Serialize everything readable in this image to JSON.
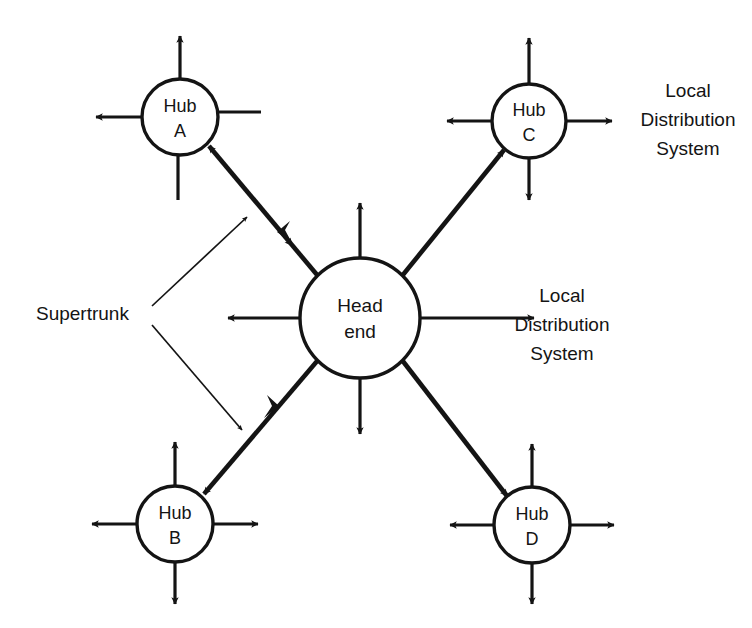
{
  "diagram": {
    "background_color": "#ffffff",
    "stroke_color": "#141414",
    "nodes": [
      {
        "id": "head-end",
        "label_line1": "Head",
        "label_line2": "end",
        "cx": 360,
        "cy": 318,
        "r": 60
      },
      {
        "id": "hub-a",
        "label_line1": "Hub",
        "label_line2": "A",
        "cx": 180,
        "cy": 117,
        "r": 38
      },
      {
        "id": "hub-b",
        "label_line1": "Hub",
        "label_line2": "B",
        "cx": 175,
        "cy": 524,
        "r": 38
      },
      {
        "id": "hub-c",
        "label_line1": "Hub",
        "label_line2": "C",
        "cx": 529,
        "cy": 121,
        "r": 37
      },
      {
        "id": "hub-d",
        "label_line1": "Hub",
        "label_line2": "D",
        "cx": 532,
        "cy": 525,
        "r": 38
      }
    ],
    "annotations": {
      "supertrunk": {
        "text": "Supertrunk",
        "x": 36,
        "y": 315
      },
      "local_distribution_top": {
        "line1": "Local",
        "line2": "Distribution",
        "line3": "System",
        "x": 688,
        "y": 92
      },
      "local_distribution_middle": {
        "line1": "Local",
        "line2": "Distribution",
        "line3": "System",
        "x": 562,
        "y": 297
      }
    }
  }
}
